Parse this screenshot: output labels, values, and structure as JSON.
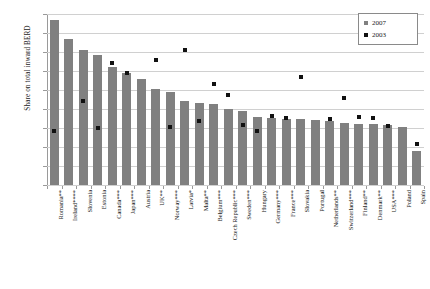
{
  "chart_data": {
    "type": "bar",
    "title": "",
    "xlabel": "",
    "ylabel": "Share on total inward BERD",
    "ylim": [
      0,
      90
    ],
    "ytick_labels": [
      "90%",
      "80%",
      "70%",
      "60%",
      "50%",
      "40%",
      "30%",
      "20%",
      "10%",
      "0%"
    ],
    "ytick_values": [
      90,
      80,
      70,
      60,
      50,
      40,
      30,
      20,
      10,
      0
    ],
    "grid": true,
    "legend_position": "top-right",
    "categories": [
      "Romania**",
      "Ireland****",
      "Slovenia",
      "Estonia",
      "Canada***",
      "Japan***",
      "Austria",
      "UK**",
      "Norway***",
      "Latvia*",
      "Malta**",
      "Belgium***",
      "Czech Republic***",
      "Sweden***",
      "Hungary",
      "Germany***",
      "France***",
      "Slovakia",
      "Portugal",
      "Netherlands**",
      "Switzerland***",
      "Finland**",
      "Denmark**",
      "USA***",
      "Poland",
      "Spain"
    ],
    "series": [
      {
        "name": "2007",
        "type": "bar",
        "color": "#808080",
        "values": [
          87,
          77,
          71,
          68.5,
          62,
          59,
          56,
          50.5,
          49,
          44,
          43,
          42.5,
          40,
          39,
          36,
          35.5,
          35,
          34.5,
          34,
          33.5,
          32.5,
          32,
          32,
          31.5,
          30.5,
          18
        ]
      },
      {
        "name": "2003",
        "type": "scatter",
        "color": "#111111",
        "values": [
          28.5,
          null,
          44,
          30,
          64,
          59,
          null,
          66,
          30.5,
          71,
          33.5,
          53,
          47.5,
          31.5,
          28.5,
          36.5,
          35.5,
          57,
          null,
          35,
          46,
          36,
          35.5,
          31,
          null,
          21.5
        ]
      }
    ]
  },
  "legend": {
    "items": [
      {
        "label": "2007",
        "swatch": "gray-square-swatch"
      },
      {
        "label": "2003",
        "swatch": "black-square-swatch"
      }
    ]
  }
}
